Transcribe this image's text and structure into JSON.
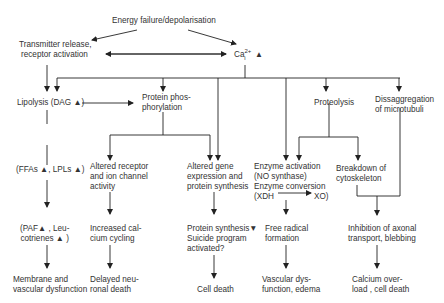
{
  "title": "Energy failure/depolarisation",
  "nodes": {
    "transmitter": [
      "Transmitter release,",
      "receptor activation"
    ],
    "calcium": {
      "base": "Ca",
      "sup": "2+",
      "sub": "i",
      "arrow": "▲"
    },
    "lipolysis": "Lipolysis (DAG ▲)",
    "protein_phos": [
      "Protein phos-",
      "phorylation"
    ],
    "proteolysis": "Proteolysis",
    "disaggregation": [
      "Dissaggregation",
      "of microtubuli"
    ],
    "ffas": "(FFAs ▲, LPLs ▲)",
    "altered_receptor": [
      "Altered receptor",
      "and ion channel",
      "activity"
    ],
    "altered_gene": [
      "Altered gene",
      "expression and",
      "protein synthesis"
    ],
    "enzyme": [
      "Enzyme activation",
      "(NO synthase)",
      "Enzyme conversion"
    ],
    "enzyme_xdh": "(XDH",
    "enzyme_xo": "XO)",
    "breakdown": [
      "Breakdown of",
      "cytoskeleton"
    ],
    "paf": [
      "(PAF▲ , Leu-",
      "cotrienes ▲ )"
    ],
    "calcium_cycling": [
      "Increased cal-",
      "cium cycling"
    ],
    "protein_synthesis": [
      "Protein synthesis▼",
      "Suicide program",
      "activated?"
    ],
    "free_radical": [
      "Free radical",
      "formation"
    ],
    "inhibition": [
      "Inhibition of  axonal",
      "transport, blebbing"
    ],
    "membrane": [
      "Membrane and",
      "vascular dysfunction"
    ],
    "delayed": [
      "Delayed neu-",
      "ronal death"
    ],
    "cell_death": "Cell death",
    "vascular": [
      "Vascular  dys-",
      "function, edema"
    ],
    "calcium_overload": [
      "Calcium over-",
      "load , cell death"
    ]
  },
  "colors": {
    "line": "#222222",
    "text": "#333333"
  }
}
